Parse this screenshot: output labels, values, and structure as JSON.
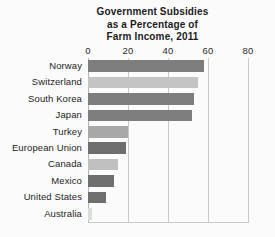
{
  "chart_data": {
    "type": "bar",
    "orientation": "horizontal",
    "title": "Government Subsidies as a Percentage of Farm Income, 2011",
    "title_lines": [
      "Government Subsidies",
      "as a Percentage of",
      "Farm Income, 2011"
    ],
    "xlabel": "",
    "ylabel": "",
    "xlim": [
      0,
      80
    ],
    "xticks": [
      0,
      20,
      40,
      60,
      80
    ],
    "xtick_labels": [
      "0",
      "20",
      "40",
      "60",
      "80"
    ],
    "grid": "vertical",
    "legend": "none",
    "categories": [
      "Norway",
      "Switzerland",
      "South Korea",
      "Japan",
      "Turkey",
      "European Union",
      "Canada",
      "Mexico",
      "United States",
      "Australia"
    ],
    "values": [
      58,
      55,
      53,
      52,
      20,
      19,
      15,
      13,
      9,
      2
    ],
    "bars": [
      {
        "label": "Norway",
        "value": 58,
        "color": "#7d7d7d"
      },
      {
        "label": "Switzerland",
        "value": 55,
        "color": "#c4c4c4"
      },
      {
        "label": "South Korea",
        "value": 53,
        "color": "#7d7d7d"
      },
      {
        "label": "Japan",
        "value": 52,
        "color": "#7d7d7d"
      },
      {
        "label": "Turkey",
        "value": 20,
        "color": "#a8a8a8"
      },
      {
        "label": "European Union",
        "value": 19,
        "color": "#6e6e6e"
      },
      {
        "label": "Canada",
        "value": 15,
        "color": "#c0c0c0"
      },
      {
        "label": "Mexico",
        "value": 13,
        "color": "#6e6e6e"
      },
      {
        "label": "United States",
        "value": 9,
        "color": "#6e6e6e"
      },
      {
        "label": "Australia",
        "value": 2,
        "color": "#dcdcdc"
      }
    ],
    "colors": {
      "dark_bar": "#7d7d7d",
      "light_bar": "#c4c4c4",
      "gridline": "#c9c9c9",
      "text": "#1d1d1d",
      "background": "#fbfbfb"
    }
  }
}
